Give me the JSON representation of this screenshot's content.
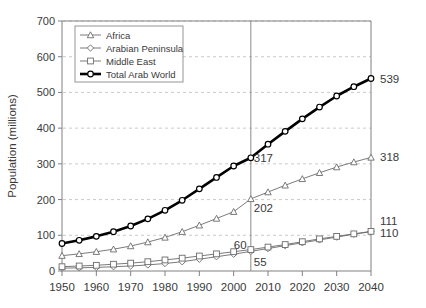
{
  "chart_data": {
    "type": "line",
    "title": "",
    "xlabel": "",
    "ylabel": "Population (millions)",
    "xlim": [
      1950,
      2040
    ],
    "ylim": [
      0,
      700
    ],
    "xticks": [
      1950,
      1960,
      1970,
      1980,
      1990,
      2000,
      2010,
      2020,
      2030,
      2040
    ],
    "yticks": [
      0,
      100,
      200,
      300,
      400,
      500,
      600,
      700
    ],
    "grid": "horizontal-dashed",
    "legend_position": "top-left-inside",
    "x": [
      1950,
      1955,
      1960,
      1965,
      1970,
      1975,
      1980,
      1985,
      1990,
      1995,
      2000,
      2005,
      2010,
      2015,
      2020,
      2025,
      2030,
      2035,
      2040
    ],
    "series": [
      {
        "name": "Africa",
        "marker": "triangle",
        "values": [
          43,
          48,
          54,
          61,
          70,
          81,
          94,
          110,
          128,
          147,
          166,
          202,
          221,
          240,
          258,
          275,
          291,
          305,
          318
        ],
        "end_label": "318",
        "mid_label": "202"
      },
      {
        "name": "Arabian Peninsula",
        "marker": "diamond",
        "values": [
          8,
          9,
          10,
          12,
          14,
          17,
          21,
          26,
          33,
          40,
          47,
          55,
          63,
          71,
          79,
          87,
          95,
          103,
          110
        ],
        "end_label": "110",
        "mid_label": "55"
      },
      {
        "name": "Middle East",
        "marker": "square",
        "values": [
          12,
          14,
          16,
          19,
          22,
          26,
          31,
          36,
          42,
          48,
          54,
          60,
          67,
          74,
          82,
          90,
          97,
          104,
          111
        ],
        "end_label": "111",
        "mid_label": "60"
      },
      {
        "name": "Total Arab World",
        "marker": "circle-bold",
        "values": [
          77,
          86,
          97,
          110,
          126,
          146,
          170,
          198,
          230,
          262,
          294,
          317,
          355,
          391,
          426,
          459,
          490,
          516,
          539
        ],
        "end_label": "539",
        "mid_label": "317"
      }
    ],
    "reference_line": {
      "x": 2005,
      "label": ""
    },
    "end_labels": [
      "539",
      "318",
      "111",
      "110"
    ],
    "mid_labels": [
      "317",
      "202",
      "60",
      "55"
    ],
    "colors": {
      "africa": "#6b6b6b",
      "arabian_peninsula": "#6b6b6b",
      "middle_east": "#6b6b6b",
      "total": "#000000",
      "grid": "#bdbdbd",
      "axis": "#808080",
      "text": "#3a3a3a"
    }
  },
  "legend": {
    "items": [
      {
        "label": "Africa"
      },
      {
        "label": "Arabian Peninsula"
      },
      {
        "label": "Middle East"
      },
      {
        "label": "Total Arab World"
      }
    ]
  },
  "axes": {
    "y_title": "Population (millions)",
    "y_labels": [
      "700",
      "600",
      "500",
      "400",
      "300",
      "200",
      "100",
      "0"
    ],
    "x_labels": [
      "1950",
      "1960",
      "1970",
      "1980",
      "1990",
      "2000",
      "2010",
      "2020",
      "2030",
      "2040"
    ]
  },
  "annotations": {
    "total_end": "539",
    "africa_end": "318",
    "middleeast_end": "111",
    "arabian_end": "110",
    "total_mid": "317",
    "africa_mid": "202",
    "middleeast_mid": "60",
    "arabian_mid": "55"
  }
}
